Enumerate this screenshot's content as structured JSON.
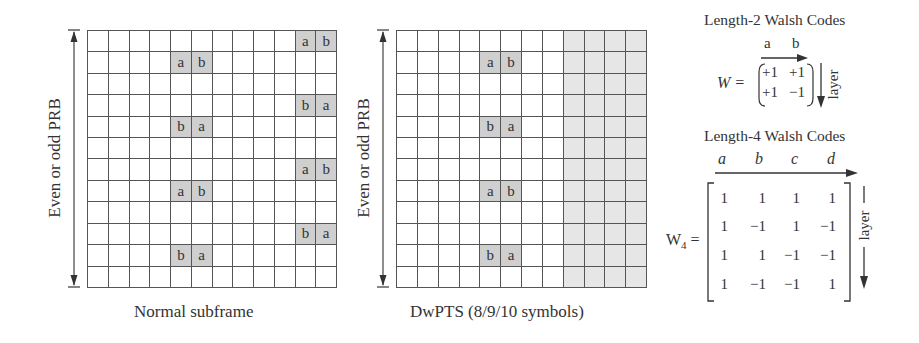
{
  "figure": {
    "left_panel": {
      "y_label": "Even or odd PRB",
      "caption": "Normal subframe",
      "rows": 12,
      "cols": 12,
      "marked_cells": [
        {
          "row": 0,
          "col": 10,
          "label": "a"
        },
        {
          "row": 0,
          "col": 11,
          "label": "b"
        },
        {
          "row": 1,
          "col": 4,
          "label": "a"
        },
        {
          "row": 1,
          "col": 5,
          "label": "b"
        },
        {
          "row": 3,
          "col": 10,
          "label": "b"
        },
        {
          "row": 3,
          "col": 11,
          "label": "a"
        },
        {
          "row": 4,
          "col": 4,
          "label": "b"
        },
        {
          "row": 4,
          "col": 5,
          "label": "a"
        },
        {
          "row": 6,
          "col": 10,
          "label": "a"
        },
        {
          "row": 6,
          "col": 11,
          "label": "b"
        },
        {
          "row": 7,
          "col": 4,
          "label": "a"
        },
        {
          "row": 7,
          "col": 5,
          "label": "b"
        },
        {
          "row": 9,
          "col": 10,
          "label": "b"
        },
        {
          "row": 9,
          "col": 11,
          "label": "a"
        },
        {
          "row": 10,
          "col": 4,
          "label": "b"
        },
        {
          "row": 10,
          "col": 5,
          "label": "a"
        }
      ],
      "shaded_cols": []
    },
    "right_panel": {
      "y_label": "Even or odd PRB",
      "caption": "DwPTS (8/9/10 symbols)",
      "rows": 12,
      "cols": 12,
      "marked_cells": [
        {
          "row": 1,
          "col": 4,
          "label": "a"
        },
        {
          "row": 1,
          "col": 5,
          "label": "b"
        },
        {
          "row": 4,
          "col": 4,
          "label": "b"
        },
        {
          "row": 4,
          "col": 5,
          "label": "a"
        },
        {
          "row": 7,
          "col": 4,
          "label": "a"
        },
        {
          "row": 7,
          "col": 5,
          "label": "b"
        },
        {
          "row": 10,
          "col": 4,
          "label": "b"
        },
        {
          "row": 10,
          "col": 5,
          "label": "a"
        }
      ],
      "shaded_cols": [
        8,
        9,
        10,
        11
      ]
    },
    "walsh2": {
      "title": "Length-2 Walsh Codes",
      "col_labels": [
        "a",
        "b"
      ],
      "lhs": "W =",
      "matrix": [
        [
          "+1",
          "+1"
        ],
        [
          "+1",
          "−1"
        ]
      ],
      "axis_label": "layer"
    },
    "walsh4": {
      "title": "Length-4 Walsh Codes",
      "col_labels": [
        "a",
        "b",
        "c",
        "d"
      ],
      "lhs_main": "W",
      "lhs_sub": "4",
      "lhs_eq": "=",
      "matrix": [
        [
          "1",
          "1",
          "1",
          "1"
        ],
        [
          "1",
          "−1",
          "1",
          "−1"
        ],
        [
          "1",
          "1",
          "−1",
          "−1"
        ],
        [
          "1",
          "−1",
          "−1",
          "1"
        ]
      ],
      "axis_label": "layer"
    },
    "colors": {
      "grid_line": "#555555",
      "marked_cell": "#cfcfcf",
      "shaded_region": "#e6e6e6",
      "text": "#333333"
    }
  }
}
